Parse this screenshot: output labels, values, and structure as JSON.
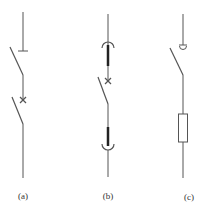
{
  "diagram": {
    "type": "electrical switch symbols",
    "stroke_color": "#555555",
    "panels": [
      {
        "id": "a",
        "label": "(a)",
        "description": "switch with stop bar and circuit-breaker cross"
      },
      {
        "id": "b",
        "label": "(b)",
        "description": "withdrawable circuit breaker with plug-in contacts"
      },
      {
        "id": "c",
        "label": "(c)",
        "description": "switch with fuse"
      }
    ]
  }
}
